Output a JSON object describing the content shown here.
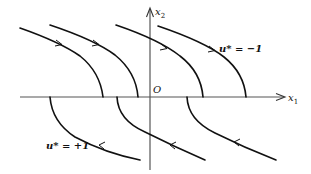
{
  "diagram": {
    "type": "phase-plane-trajectories",
    "axes": {
      "horizontal": {
        "symbol": "x",
        "subscript": "1"
      },
      "vertical": {
        "symbol": "x",
        "subscript": "2"
      },
      "origin_label": "O"
    },
    "families": [
      {
        "name": "u-minus-one",
        "label": "u* = −1",
        "region": "upper half-plane",
        "direction": "left-to-right, descending to x1 axis",
        "curve_count": 4
      },
      {
        "name": "u-plus-one",
        "label": "u* = +1",
        "region": "lower half-plane",
        "direction": "right-to-left, ascending to x1 axis",
        "curve_count": 3
      }
    ],
    "colors": {
      "curves": "#111111",
      "axes": "#555555",
      "background": "#ffffff"
    }
  }
}
